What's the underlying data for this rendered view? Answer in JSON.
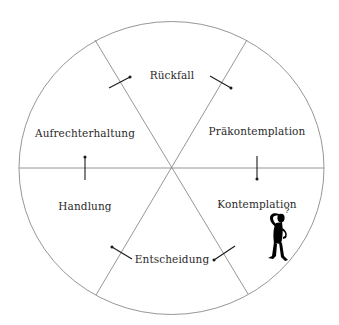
{
  "diagram": {
    "type": "stages-of-change-cycle",
    "colors": {
      "line": "#8a8a8a",
      "arrow": "#1a1a1a",
      "text": "#2a2a2a",
      "figure": "#000000"
    },
    "stages": [
      {
        "id": "rueckfall",
        "label": "Rückfall",
        "x": 172,
        "y": 75
      },
      {
        "id": "praekontemplation",
        "label": "Präkontemplation",
        "x": 257,
        "y": 131
      },
      {
        "id": "kontemplation",
        "label": "Kontemplation",
        "x": 257,
        "y": 204
      },
      {
        "id": "entscheidung",
        "label": "Entscheidung",
        "x": 172,
        "y": 259
      },
      {
        "id": "handlung",
        "label": "Handlung",
        "x": 85,
        "y": 206
      },
      {
        "id": "aufrechterhaltung",
        "label": "Aufrechterhaltung",
        "x": 85,
        "y": 133
      }
    ],
    "figure": {
      "name": "thinking-person-icon",
      "symbol": "?"
    }
  }
}
